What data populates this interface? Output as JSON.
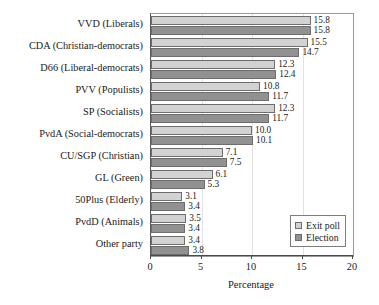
{
  "chart_data": {
    "type": "bar",
    "orientation": "horizontal",
    "title": "",
    "xlabel": "Percentage",
    "ylabel": "",
    "xlim": [
      0,
      20
    ],
    "xticks": [
      0,
      5,
      10,
      15,
      20
    ],
    "grid": true,
    "legend_position": "center-right",
    "categories": [
      "VVD (Liberals)",
      "CDA (Christian-democrats)",
      "D66 (Liberal-democrats)",
      "PVV (Populists)",
      "SP (Socialists)",
      "PvdA (Social-democrats)",
      "CU/SGP (Christian)",
      "GL (Green)",
      "50Plus (Elderly)",
      "PvdD (Animals)",
      "Other party"
    ],
    "series": [
      {
        "name": "Exit poll",
        "color": "#d2d2d2",
        "values": [
          15.8,
          15.5,
          12.3,
          10.8,
          12.3,
          10.0,
          7.1,
          6.1,
          3.1,
          3.5,
          3.4
        ]
      },
      {
        "name": "Election",
        "color": "#919191",
        "values": [
          15.8,
          14.7,
          12.4,
          11.7,
          11.7,
          10.1,
          7.5,
          5.3,
          3.4,
          3.4,
          3.8
        ]
      }
    ],
    "value_labels": {
      "exit_poll": [
        "15.8",
        "15.5",
        "12.3",
        "10.8",
        "12.3",
        "10.0",
        "7.1",
        "6.1",
        "3.1",
        "3.5",
        "3.4"
      ],
      "election": [
        "15.8",
        "14.7",
        "12.4",
        "11.7",
        "11.7",
        "10.1",
        "7.5",
        "5.3",
        "3.4",
        "3.4",
        "3.8"
      ]
    },
    "xticklabels": [
      "0",
      "5",
      "10",
      "15",
      "20"
    ]
  }
}
